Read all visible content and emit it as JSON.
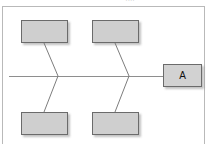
{
  "canvas": {
    "width": 212,
    "height": 144,
    "background": "#ffffff"
  },
  "artifact": {
    "top_clipped_text": "····"
  },
  "frame": {
    "border_color": "#b9b9b9",
    "background": "#ffffff"
  },
  "diagram": {
    "type": "fishbone-flow",
    "spine": {
      "label": "",
      "color": "#8e8e8e",
      "x1": 9,
      "y1": 76,
      "x2": 163,
      "y2": 76
    },
    "node_fill": "#cfcfcf",
    "node_border": "#6b6b6b",
    "nodes": [
      {
        "id": "top-left",
        "label": "",
        "position": "top-left"
      },
      {
        "id": "top-right",
        "label": "",
        "position": "top-right"
      },
      {
        "id": "bottom-left",
        "label": "",
        "position": "bottom-left"
      },
      {
        "id": "bottom-right",
        "label": "",
        "position": "bottom-right"
      },
      {
        "id": "output",
        "label": "A",
        "position": "right"
      }
    ],
    "connectors": [
      {
        "id": "connector-left",
        "from": "top-left",
        "to": "bottom-left",
        "via_spine_x": 58,
        "points": "44,43 58,76 44,112"
      },
      {
        "id": "connector-right",
        "from": "top-right",
        "to": "bottom-right",
        "via_spine_x": 129,
        "points": "115,43 129,76 115,112"
      }
    ]
  }
}
